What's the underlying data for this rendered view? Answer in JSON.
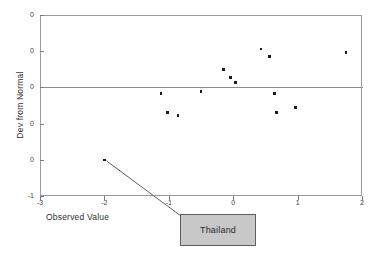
{
  "chart_data": {
    "type": "scatter",
    "title": "",
    "xlabel": "Observed Value",
    "ylabel": "Dev from Normal",
    "xlim": [
      -3,
      2
    ],
    "ylim": [
      -1.0,
      0.8
    ],
    "grid": false,
    "legend": null,
    "xticks": [
      "-3",
      "-2",
      "-1",
      "0",
      "1",
      "2"
    ],
    "xtick_values": [
      -3,
      -2,
      -1,
      0,
      1,
      2
    ],
    "yticks": [
      "0",
      "0",
      "0",
      "0",
      "0",
      "-1"
    ],
    "ytick_values": [
      0.8,
      0.44,
      0.08,
      -0.28,
      -0.64,
      -1.0
    ],
    "reference_line": {
      "orientation": "horizontal",
      "value": 0.08
    },
    "points": [
      {
        "x": -2.0,
        "y": -0.64
      },
      {
        "x": -1.12,
        "y": 0.02
      },
      {
        "x": -1.02,
        "y": -0.17
      },
      {
        "x": -0.86,
        "y": -0.2
      },
      {
        "x": -0.5,
        "y": 0.04
      },
      {
        "x": -0.15,
        "y": 0.26
      },
      {
        "x": -0.04,
        "y": 0.18
      },
      {
        "x": 0.04,
        "y": 0.13
      },
      {
        "x": 0.43,
        "y": 0.46
      },
      {
        "x": 0.56,
        "y": 0.39
      },
      {
        "x": 0.64,
        "y": 0.02
      },
      {
        "x": 0.67,
        "y": -0.17
      },
      {
        "x": 0.97,
        "y": -0.12
      },
      {
        "x": 1.75,
        "y": 0.43
      }
    ]
  },
  "annotation": {
    "label": "Thailand",
    "target_x": -2.0,
    "target_y": -0.64
  },
  "colors": {
    "point": "#1c1c1c",
    "frame": "#9a9a9a",
    "reference_line": "#8c8c8c",
    "callout_fill": "#c8c8c8",
    "callout_border": "#5d5d5d",
    "text": "#2f2f2f"
  }
}
